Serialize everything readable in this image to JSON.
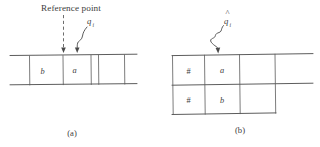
{
  "figure": {
    "annotation_title": "Reference point",
    "panel_a": {
      "caption": "(a)",
      "pointer_label_base": "q",
      "pointer_label_sub": "i",
      "cells": [
        "",
        "b",
        "a",
        "",
        ""
      ],
      "filled_cells": [
        "b",
        "a"
      ]
    },
    "panel_b": {
      "caption": "(b)",
      "pointer_label_base": "q",
      "pointer_label_sub": "i",
      "pointer_label_accent": "^",
      "top_row": [
        "#",
        "a",
        "",
        ""
      ],
      "bottom_row": [
        "#",
        "b",
        "",
        ""
      ]
    },
    "colors": {
      "ink": "#4a4a4a",
      "background": "#ffffff",
      "text": "#3d3d3d"
    }
  }
}
